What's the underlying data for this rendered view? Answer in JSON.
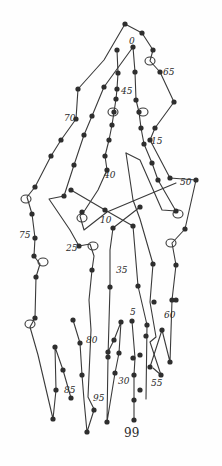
{
  "diagram": {
    "type": "hand-drawn numbered dot-path drawing",
    "ink_color": "#2e2e2e",
    "background": "#fefefe",
    "labels": [
      {
        "id": "l0",
        "text": "0",
        "x": 129,
        "y": 44
      },
      {
        "id": "l65",
        "text": "65",
        "x": 163,
        "y": 75
      },
      {
        "id": "l45",
        "text": "45",
        "x": 121,
        "y": 94
      },
      {
        "id": "l70",
        "text": "70",
        "x": 64,
        "y": 121
      },
      {
        "id": "l15",
        "text": "15",
        "x": 151,
        "y": 144
      },
      {
        "id": "l40",
        "text": "40",
        "x": 104,
        "y": 178
      },
      {
        "id": "l50",
        "text": "50",
        "x": 180,
        "y": 185
      },
      {
        "id": "l10",
        "text": "10",
        "x": 100,
        "y": 223
      },
      {
        "id": "l75",
        "text": "75",
        "x": 19,
        "y": 238
      },
      {
        "id": "l25",
        "text": "25",
        "x": 66,
        "y": 251
      },
      {
        "id": "l35",
        "text": "35",
        "x": 116,
        "y": 273
      },
      {
        "id": "l5",
        "text": "5",
        "x": 130,
        "y": 315
      },
      {
        "id": "l60",
        "text": "60",
        "x": 164,
        "y": 318
      },
      {
        "id": "l80",
        "text": "80",
        "x": 86,
        "y": 343
      },
      {
        "id": "l30",
        "text": "30",
        "x": 118,
        "y": 384
      },
      {
        "id": "l55",
        "text": "55",
        "x": 151,
        "y": 386
      },
      {
        "id": "l85",
        "text": "85",
        "x": 64,
        "y": 393
      },
      {
        "id": "l95",
        "text": "95",
        "x": 93,
        "y": 401
      },
      {
        "id": "l99",
        "text": "99",
        "x": 124,
        "y": 437
      }
    ],
    "paths": [
      {
        "id": "outer-left",
        "points": "125,24 104,60 78,89 76,119 61,140 51,156 35,187 27,197 32,214 35,238 34,256 40,264 36,277 35,318 30,327 38,355 53,419 56,390 55,347 63,370 71,398"
      },
      {
        "id": "outer-right",
        "points": "125,24 142,33 153,50 150,61 160,72 174,102 155,128 150,140 170,178 196,180 185,229 172,243 176,265 172,300 170,362 162,330 150,367"
      },
      {
        "id": "inner-a",
        "points": "117,50 118,73 117,89 116,99 114,112 112,125 109,140 105,156 107,170 98,190 85,210 80,216 84,230 107,212 176,183"
      },
      {
        "id": "inner-b",
        "points": "133,47 104,87 92,116 84,135 74,165 64,196 49,199 70,230 79,246 90,244 94,256 92,270 89,300 91,330 88,397 94,409"
      },
      {
        "id": "inner-c",
        "points": "133,47 135,72 136,100 139,112 141,128 144,144 152,163 158,180 173,206 176,211 162,210 140,160 126,153"
      },
      {
        "id": "cross-1",
        "points": "71,190 105,210 133,226 138,286 147,325 146,399"
      },
      {
        "id": "cross-2",
        "points": "140,207 113,228 110,250 110,287 108,357 107,422 115,373 119,353 121,322 114,340 108,352"
      },
      {
        "id": "center-right",
        "points": "126,153 133,200 140,219 153,264 150,302 156,337 150,342 161,375 153,368"
      },
      {
        "id": "center-low",
        "points": "132,321 135,358 134,375 134,400 134,420"
      },
      {
        "id": "left-zig",
        "points": "73,320 80,343 82,375 84,400 87,432 94,410"
      }
    ],
    "dots": [
      [
        125,
        24
      ],
      [
        142,
        33
      ],
      [
        153,
        50
      ],
      [
        160,
        72
      ],
      [
        174,
        102
      ],
      [
        155,
        128
      ],
      [
        150,
        140
      ],
      [
        170,
        178
      ],
      [
        196,
        180
      ],
      [
        185,
        229
      ],
      [
        176,
        265
      ],
      [
        172,
        300
      ],
      [
        170,
        362
      ],
      [
        117,
        50
      ],
      [
        133,
        47
      ],
      [
        118,
        73
      ],
      [
        135,
        72
      ],
      [
        117,
        89
      ],
      [
        136,
        100
      ],
      [
        116,
        99
      ],
      [
        139,
        112
      ],
      [
        114,
        112
      ],
      [
        112,
        125
      ],
      [
        141,
        128
      ],
      [
        109,
        140
      ],
      [
        144,
        144
      ],
      [
        105,
        156
      ],
      [
        152,
        163
      ],
      [
        158,
        180
      ],
      [
        107,
        170
      ],
      [
        104,
        87
      ],
      [
        92,
        116
      ],
      [
        84,
        135
      ],
      [
        74,
        165
      ],
      [
        64,
        196
      ],
      [
        78,
        89
      ],
      [
        76,
        119
      ],
      [
        61,
        140
      ],
      [
        51,
        156
      ],
      [
        35,
        187
      ],
      [
        32,
        214
      ],
      [
        35,
        238
      ],
      [
        34,
        256
      ],
      [
        36,
        277
      ],
      [
        35,
        318
      ],
      [
        53,
        419
      ],
      [
        71,
        190
      ],
      [
        105,
        210
      ],
      [
        133,
        226
      ],
      [
        140,
        207
      ],
      [
        113,
        228
      ],
      [
        176,
        211
      ],
      [
        82,
        212
      ],
      [
        79,
        246
      ],
      [
        92,
        270
      ],
      [
        110,
        287
      ],
      [
        138,
        286
      ],
      [
        147,
        325
      ],
      [
        153,
        264
      ],
      [
        154,
        302
      ],
      [
        176,
        300
      ],
      [
        73,
        320
      ],
      [
        80,
        343
      ],
      [
        82,
        375
      ],
      [
        87,
        432
      ],
      [
        94,
        410
      ],
      [
        56,
        390
      ],
      [
        55,
        347
      ],
      [
        63,
        370
      ],
      [
        71,
        398
      ],
      [
        108,
        357
      ],
      [
        107,
        422
      ],
      [
        115,
        373
      ],
      [
        119,
        353
      ],
      [
        121,
        322
      ],
      [
        114,
        340
      ],
      [
        108,
        352
      ],
      [
        132,
        321
      ],
      [
        133,
        358
      ],
      [
        134,
        375
      ],
      [
        134,
        400
      ],
      [
        134,
        420
      ],
      [
        162,
        330
      ],
      [
        150,
        367
      ],
      [
        161,
        375
      ],
      [
        146,
        336
      ],
      [
        140,
        355
      ],
      [
        140,
        390
      ]
    ],
    "loops": [
      {
        "id": "loop-1",
        "cx": 150,
        "cy": 61,
        "r": 4
      },
      {
        "id": "loop-2",
        "cx": 113,
        "cy": 112,
        "r": 4
      },
      {
        "id": "loop-3",
        "cx": 143,
        "cy": 112,
        "r": 4
      },
      {
        "id": "loop-4",
        "cx": 26,
        "cy": 199,
        "r": 4
      },
      {
        "id": "loop-5",
        "cx": 82,
        "cy": 218,
        "r": 4
      },
      {
        "id": "loop-6",
        "cx": 178,
        "cy": 214,
        "r": 4
      },
      {
        "id": "loop-7",
        "cx": 171,
        "cy": 243,
        "r": 4
      },
      {
        "id": "loop-8",
        "cx": 93,
        "cy": 246,
        "r": 4
      },
      {
        "id": "loop-9",
        "cx": 43,
        "cy": 262,
        "r": 4
      },
      {
        "id": "loop-10",
        "cx": 30,
        "cy": 324,
        "r": 4
      }
    ]
  }
}
